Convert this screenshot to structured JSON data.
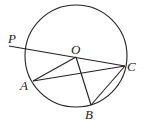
{
  "diagram": {
    "type": "geometry",
    "circle": {
      "center": "O",
      "cx": 76,
      "cy": 56,
      "r": 51
    },
    "points": {
      "P": {
        "label": "P",
        "x": 9,
        "y": 46
      },
      "O": {
        "label": "O",
        "x": 76,
        "y": 57
      },
      "A": {
        "label": "A",
        "x": 33,
        "y": 81
      },
      "B": {
        "label": "B",
        "x": 91,
        "y": 105
      },
      "C": {
        "label": "C",
        "x": 125,
        "y": 66
      }
    },
    "segments": [
      "PC",
      "OA",
      "OB",
      "AC",
      "BC"
    ]
  }
}
